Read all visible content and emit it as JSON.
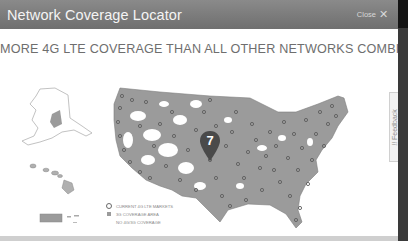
{
  "modal": {
    "title": "Network Coverage Locator",
    "close_label": "Close",
    "close_icon": "close-x-icon"
  },
  "headline": "MORE 4G LTE COVERAGE THAN ALL OTHER NETWORKS COMBINED",
  "map": {
    "pin_number": "7",
    "regions": [
      "Contiguous US",
      "Alaska",
      "Hawaii",
      "Puerto Rico"
    ],
    "colors": {
      "coverage_3g": "#9b9b9b",
      "no_coverage": "#ffffff",
      "lte_marker": "#6a6a6a",
      "pin": "#4a4a4a"
    }
  },
  "legend": {
    "items": [
      {
        "icon": "ring-marker-icon",
        "label": "CURRENT 4G LTE MARKETS"
      },
      {
        "icon": "gray-square-icon",
        "label": "3G COVERAGE AREA"
      },
      {
        "icon": "blank-icon",
        "label": "NO 4G/3G COVERAGE"
      }
    ]
  },
  "feedback": {
    "label": "Feedback",
    "prefix": "!!"
  }
}
